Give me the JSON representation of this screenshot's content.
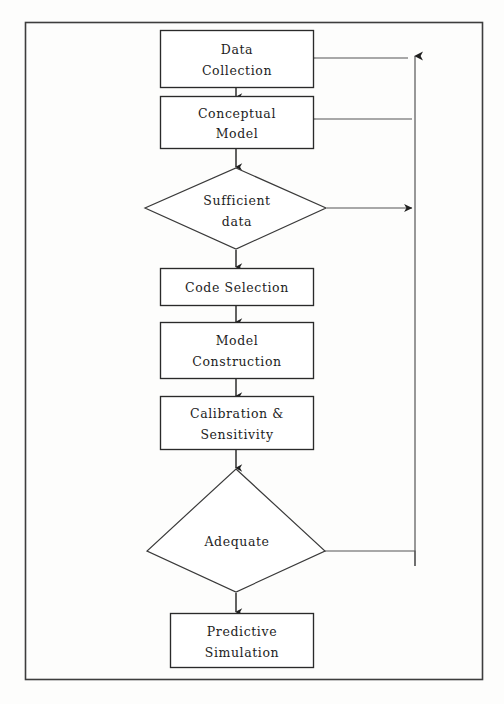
{
  "figure": {
    "type": "flowchart",
    "orientation": "top-to-bottom",
    "frame": {
      "visible": true
    },
    "clipped_caption_bottom": "",
    "clipped_caption_top": ""
  },
  "nodes": [
    {
      "id": "data-collection",
      "shape": "rectangle",
      "label_lines": [
        "Data",
        "Collection"
      ],
      "line1": "Data",
      "line2": "Collection"
    },
    {
      "id": "conceptual-model",
      "shape": "rectangle",
      "label_lines": [
        "Conceptual",
        "Model"
      ],
      "line1": "Conceptual",
      "line2": "Model"
    },
    {
      "id": "sufficient-data",
      "shape": "diamond",
      "label_lines": [
        "Sufficient",
        "data"
      ],
      "line1": "Sufficient",
      "line2": "data"
    },
    {
      "id": "code-selection",
      "shape": "rectangle",
      "label_lines": [
        "Code Selection"
      ],
      "line1": "Code Selection",
      "line2": ""
    },
    {
      "id": "model-construction",
      "shape": "rectangle",
      "label_lines": [
        "Model",
        "Construction"
      ],
      "line1": "Model",
      "line2": "Construction"
    },
    {
      "id": "calibration-sensitivity",
      "shape": "rectangle",
      "label_lines": [
        "Calibration &",
        "Sensitivity"
      ],
      "line1": "Calibration &",
      "line2": "Sensitivity"
    },
    {
      "id": "adequate",
      "shape": "diamond",
      "label_lines": [
        "Adequate"
      ],
      "line1": "Adequate",
      "line2": ""
    },
    {
      "id": "predictive-simulation",
      "shape": "rectangle",
      "label_lines": [
        "Predictive",
        "Simulation"
      ],
      "line1": "Predictive",
      "line2": "Simulation"
    }
  ],
  "edges": [
    {
      "id": "e1",
      "from": "data-collection",
      "to": "conceptual-model",
      "kind": "forward",
      "label": ""
    },
    {
      "id": "e2",
      "from": "conceptual-model",
      "to": "sufficient-data",
      "kind": "forward",
      "label": ""
    },
    {
      "id": "e3",
      "from": "sufficient-data",
      "to": "code-selection",
      "kind": "forward",
      "label": ""
    },
    {
      "id": "e4",
      "from": "code-selection",
      "to": "model-construction",
      "kind": "forward",
      "label": ""
    },
    {
      "id": "e5",
      "from": "model-construction",
      "to": "calibration-sensitivity",
      "kind": "forward",
      "label": ""
    },
    {
      "id": "e6",
      "from": "calibration-sensitivity",
      "to": "adequate",
      "kind": "forward",
      "label": ""
    },
    {
      "id": "e7",
      "from": "adequate",
      "to": "predictive-simulation",
      "kind": "forward",
      "label": ""
    },
    {
      "id": "e8",
      "from": "sufficient-data",
      "to": "feedback-bus",
      "kind": "branch-right",
      "label": ""
    },
    {
      "id": "e9",
      "from": "adequate",
      "to": "feedback-bus",
      "kind": "branch-right",
      "label": ""
    },
    {
      "id": "e10",
      "from": "feedback-bus",
      "to": "data-collection",
      "kind": "feedback",
      "label": ""
    },
    {
      "id": "e11",
      "from": "feedback-bus",
      "to": "conceptual-model",
      "kind": "feedback",
      "label": ""
    }
  ],
  "colors": {
    "stroke": "#2a2a2a",
    "feedback_stroke": "#555555",
    "text": "#1d1d1d",
    "background": "#fdfdfc",
    "frame": "#3d3d3d"
  }
}
